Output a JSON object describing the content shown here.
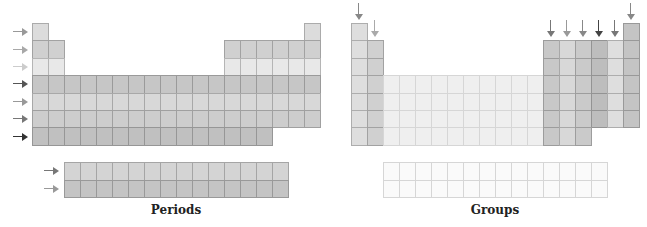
{
  "layout": {
    "cell_w": 16,
    "cell_h": 17.4,
    "top": 23,
    "f_top": 162,
    "f_cell_h": 17.5
  },
  "periods_panel": {
    "caption": "Periods",
    "origin_x": 32,
    "f_origin_x": 64,
    "row_colors": [
      "#dcdcdc",
      "#d0d0d0",
      "#e8e8e8",
      "#c6c6c6",
      "#d8d8d8",
      "#cdcdcd",
      "#c0c0c0"
    ],
    "arrow_colors": [
      "#999999",
      "#a8a8a8",
      "#cccccc",
      "#555555",
      "#999999",
      "#777777",
      "#333333"
    ],
    "f_row_colors": [
      "#d4d4d4",
      "#c4c4c4"
    ],
    "f_arrow_colors": [
      "#777777",
      "#999999"
    ]
  },
  "groups_panel": {
    "caption": "Groups",
    "origin_x": 351,
    "f_origin_x": 383,
    "group_colors": {
      "1": "#dedede",
      "2": "#d0d0d0",
      "d": "#efefef",
      "13": "#c8c8c8",
      "14": "#d8d8d8",
      "15": "#cacaca",
      "16": "#bdbdbd",
      "17": "#dedede",
      "18": "#c4c4c4"
    },
    "arrow_groups": [
      1,
      2,
      13,
      14,
      15,
      16,
      17,
      18
    ],
    "arrow_colors": {
      "1": "#888888",
      "2": "#aaaaaa",
      "13": "#777777",
      "14": "#999999",
      "15": "#888888",
      "16": "#444444",
      "17": "#777777",
      "18": "#888888"
    },
    "f_color": "#fafafa"
  },
  "table_shape": {
    "rows": [
      [
        1,
        18
      ],
      [
        1,
        2,
        13,
        14,
        15,
        16,
        17,
        18
      ],
      [
        1,
        2,
        13,
        14,
        15,
        16,
        17,
        18
      ],
      [
        1,
        2,
        3,
        4,
        5,
        6,
        7,
        8,
        9,
        10,
        11,
        12,
        13,
        14,
        15,
        16,
        17,
        18
      ],
      [
        1,
        2,
        3,
        4,
        5,
        6,
        7,
        8,
        9,
        10,
        11,
        12,
        13,
        14,
        15,
        16,
        17,
        18
      ],
      [
        1,
        2,
        3,
        4,
        5,
        6,
        7,
        8,
        9,
        10,
        11,
        12,
        13,
        14,
        15,
        16,
        17,
        18
      ],
      [
        1,
        2,
        3,
        4,
        5,
        6,
        7,
        8,
        9,
        10,
        11,
        12,
        13,
        14,
        15
      ]
    ],
    "f_block_columns": 14,
    "f_block_rows": 2
  }
}
